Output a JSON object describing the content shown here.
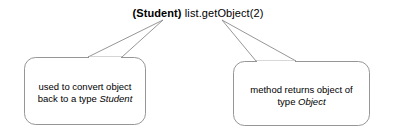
{
  "diagram": {
    "type": "annotated-code-callout",
    "background_color": "#ffffff",
    "stroke_color": "#888888",
    "text_color": "#000000",
    "code": {
      "cast": "(Student)",
      "call": " list.getObject(2)",
      "full": "(Student) list.getObject(2)"
    },
    "callouts": [
      {
        "id": "left",
        "points_to": "(Student)",
        "line1": "used to convert object",
        "line2_prefix": "back to a type ",
        "line2_term": "Student"
      },
      {
        "id": "right",
        "points_to": "list.getObject(2)",
        "line1": "method returns object of",
        "line2_prefix": "type ",
        "line2_term": "Object"
      }
    ]
  }
}
